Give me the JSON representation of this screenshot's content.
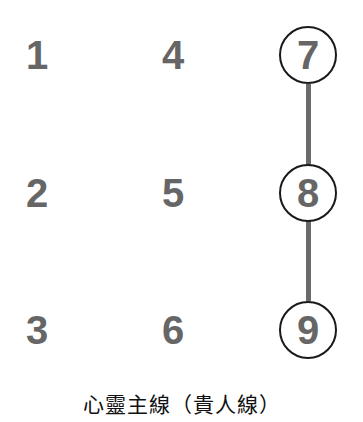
{
  "grid": {
    "columns": [
      {
        "x": 37,
        "cells": [
          {
            "label": "1",
            "y": 55,
            "circled": false
          },
          {
            "label": "2",
            "y": 193,
            "circled": false
          },
          {
            "label": "3",
            "y": 330,
            "circled": false
          }
        ]
      },
      {
        "x": 173,
        "cells": [
          {
            "label": "4",
            "y": 55,
            "circled": false
          },
          {
            "label": "5",
            "y": 193,
            "circled": false
          },
          {
            "label": "6",
            "y": 330,
            "circled": false
          }
        ]
      },
      {
        "x": 308,
        "cells": [
          {
            "label": "7",
            "y": 55,
            "circled": true
          },
          {
            "label": "8",
            "y": 193,
            "circled": true
          },
          {
            "label": "9",
            "y": 330,
            "circled": true
          }
        ]
      }
    ]
  },
  "line": {
    "path": [
      "7",
      "8",
      "9"
    ],
    "color": "#6a6a6a",
    "x": 308,
    "y_start": 55,
    "y_end": 330
  },
  "colors": {
    "digit": "#666666",
    "circle_stroke": "#1a1a1a",
    "caption": "#111111",
    "background": "#ffffff"
  },
  "caption": "心靈主線（貴人線）"
}
